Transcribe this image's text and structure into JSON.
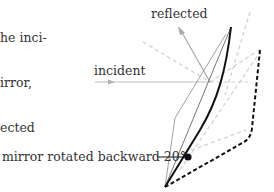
{
  "caption": {
    "lines": [
      "he inci-",
      "irror,",
      "ected"
    ]
  },
  "labels": {
    "reflected": "reflected",
    "incident": "incident",
    "mirror_rotated": "mirror rotated backward 20°"
  },
  "diagram": {
    "rotation_angle_deg": 20,
    "colors": {
      "mirror": "#111111",
      "rotated_mirror": "#111111",
      "incident_ray": "#b5b5b5",
      "reflected_ray": "#a9a9a9",
      "dashed_guides": "#c8c8c8",
      "text": "#333333"
    }
  }
}
